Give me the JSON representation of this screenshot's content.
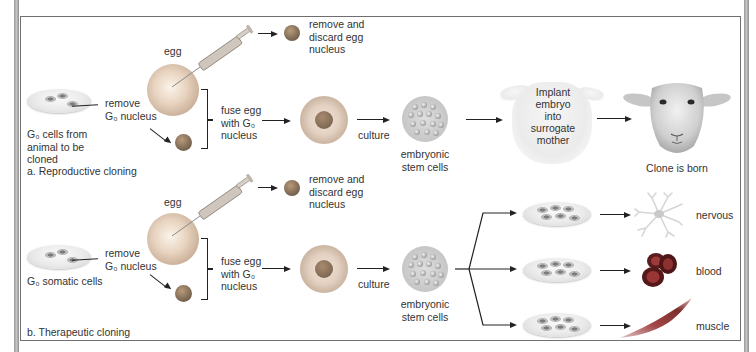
{
  "figure": {
    "panels": [
      {
        "id": "a",
        "label": "a. Reproductive cloning",
        "source_label_lines": [
          "G₀ cells from",
          "animal to be",
          "cloned"
        ],
        "remove_nucleus": [
          "remove",
          "G₀ nucleus"
        ],
        "egg_label": "egg",
        "discard_label": [
          "remove and",
          "discard egg",
          "nucleus"
        ],
        "fuse_label": [
          "fuse egg",
          "with G₀",
          "nucleus"
        ],
        "culture_label": "culture",
        "stem_label": [
          "embryonic",
          "stem cells"
        ],
        "implant_label": [
          "Implant",
          "embryo",
          "into",
          "surrogate",
          "mother"
        ],
        "result_label": "Clone is born"
      },
      {
        "id": "b",
        "label": "b. Therapeutic cloning",
        "source_label_lines": [
          "G₀ somatic cells"
        ],
        "remove_nucleus": [
          "remove",
          "G₀ nucleus"
        ],
        "egg_label": "egg",
        "discard_label": [
          "remove and",
          "discard egg",
          "nucleus"
        ],
        "fuse_label": [
          "fuse egg",
          "with G₀",
          "nucleus"
        ],
        "culture_label": "culture",
        "stem_label": [
          "embryonic",
          "stem cells"
        ],
        "tissues": [
          "nervous",
          "blood",
          "muscle"
        ]
      }
    ]
  },
  "icons": {
    "syringe": "syringe-icon",
    "petri_dish": "petri-dish-icon",
    "egg_cell": "egg-cell-icon",
    "nucleus": "nucleus-icon",
    "stem_cells": "stem-cell-cluster-icon",
    "sheep": "sheep-icon",
    "neuron": "neuron-icon",
    "red_blood_cells": "red-blood-cell-icon",
    "muscle_cell": "muscle-cell-icon"
  },
  "colors": {
    "frame_border": "#6f6f6f",
    "outer_bar": "#a8a8a8",
    "arrow": "#222222",
    "text": "#333333",
    "nucleus": "#7e6a55",
    "blood": "#7a2020",
    "muscle": "#9c4a4a"
  }
}
